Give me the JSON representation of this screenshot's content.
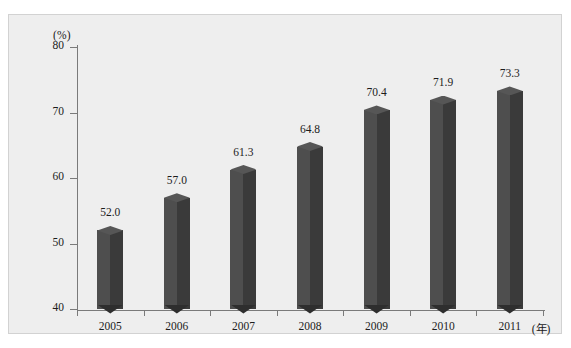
{
  "chart_data": {
    "type": "bar",
    "title": "",
    "subtitle": "",
    "xlabel": "(年)",
    "ylabel": "(%)",
    "categories": [
      "2005",
      "2006",
      "2007",
      "2008",
      "2009",
      "2010",
      "2011"
    ],
    "values": [
      52.0,
      57.0,
      61.3,
      64.8,
      70.4,
      71.9,
      73.3
    ],
    "value_labels": [
      "52.0",
      "57.0",
      "61.3",
      "64.8",
      "70.4",
      "71.9",
      "73.3"
    ],
    "ylim": [
      40,
      80
    ],
    "y_ticks": [
      80,
      70,
      60,
      50,
      40
    ],
    "y_tick_labels": [
      "80",
      "70",
      "60",
      "50",
      "40"
    ],
    "grid": false,
    "legend": false,
    "legend_position": "none",
    "series": [
      {
        "name": "",
        "values": [
          52.0,
          57.0,
          61.3,
          64.8,
          70.4,
          71.9,
          73.3
        ]
      }
    ],
    "style": {
      "bar_front_color": "#3a3a3a",
      "bar_left_color": "#4e4e4e",
      "bar_top_color": "#565656",
      "plot_background": "#eeeeee",
      "axis_color": "#7a7a7a",
      "text_color": "#1c1c1c",
      "three_d": true
    }
  },
  "axis": {
    "y_unit_label": "(%)",
    "x_unit_label": "(年)"
  }
}
